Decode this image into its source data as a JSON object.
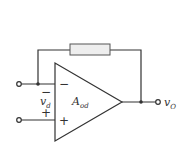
{
  "diagram": {
    "amplifier": {
      "gain_label": "A",
      "gain_subscript": "od"
    },
    "inputs": {
      "inverting_sign": "−",
      "noninverting_sign": "+",
      "differential_label": "v",
      "differential_subscript": "d",
      "diff_minus": "−",
      "diff_plus": "+"
    },
    "output": {
      "label": "v",
      "subscript": "O"
    },
    "colors": {
      "wire": "#333333",
      "resistor_fill": "#eeeeee",
      "resistor_stroke": "#555555"
    }
  }
}
